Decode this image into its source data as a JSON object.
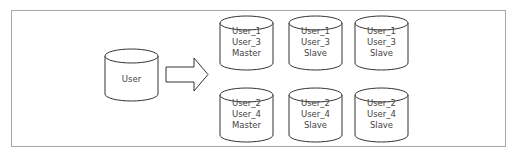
{
  "diagram": {
    "source": {
      "label": "User"
    },
    "arrow": {
      "direction": "right"
    },
    "shards": [
      {
        "lines": [
          "User_1",
          "User_3",
          "Master"
        ]
      },
      {
        "lines": [
          "User_1",
          "User_3",
          "Slave"
        ]
      },
      {
        "lines": [
          "User_1",
          "User_3",
          "Slave"
        ]
      },
      {
        "lines": [
          "User_2",
          "User_4",
          "Master"
        ]
      },
      {
        "lines": [
          "User_2",
          "User_4",
          "Slave"
        ]
      },
      {
        "lines": [
          "User_2",
          "User_4",
          "Slave"
        ]
      }
    ]
  }
}
